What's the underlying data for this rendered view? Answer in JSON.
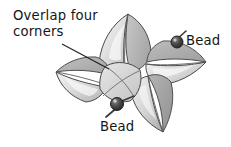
{
  "figure": {
    "type": "grayscale line illustration",
    "background_color": "#ffffff",
    "ink_color": "#151515",
    "palette": {
      "outline": "#4a4a4a",
      "outline_dark": "#2f2f2f",
      "blade_light": "#efefef",
      "blade_mid": "#d9d9d9",
      "blade_shade": "#b9b9b9",
      "blade_deep": "#9a9a9a",
      "highlight": "#fbfbfb",
      "bead_dark": "#2a2a2a",
      "bead_mid": "#555555",
      "pin_color": "#3a3a3a",
      "leader_line": "#1f1f1f"
    }
  },
  "labels": {
    "overlap": {
      "line1": "Overlap four",
      "line2": "corners"
    },
    "bead_top": "Bead",
    "bead_bottom": "Bead"
  },
  "annotations": {
    "leader_line": {
      "from_x": 62,
      "from_y": 44,
      "to_x": 109,
      "to_y": 69
    }
  },
  "parts": {
    "blades": [
      {
        "name": "blade-top",
        "tip_x": 128,
        "tip_y": 14
      },
      {
        "name": "blade-right",
        "tip_x": 206,
        "tip_y": 62
      },
      {
        "name": "blade-bottom",
        "tip_x": 163,
        "tip_y": 132
      },
      {
        "name": "blade-left",
        "tip_x": 56,
        "tip_y": 72
      }
    ],
    "beads": [
      {
        "name": "bead-top-right",
        "x": 177,
        "y": 41,
        "radius": 6
      },
      {
        "name": "bead-bottom-left",
        "x": 117,
        "y": 104,
        "radius": 6.5
      }
    ]
  }
}
